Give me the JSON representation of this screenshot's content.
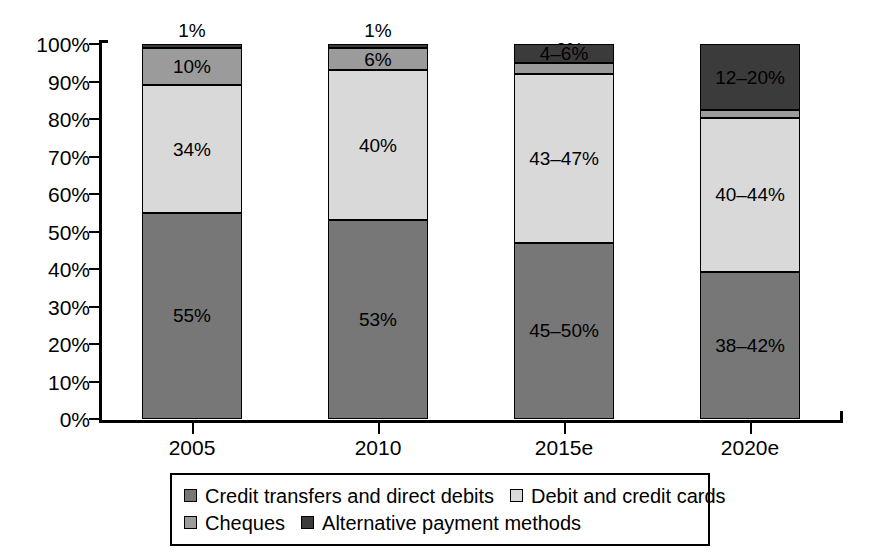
{
  "chart_data": {
    "type": "bar",
    "stacked": true,
    "normalized_percent": true,
    "title": "",
    "xlabel": "",
    "ylabel": "",
    "ylim": [
      0,
      100
    ],
    "grid": false,
    "legend_position": "bottom",
    "categories": [
      "2005",
      "2010",
      "2015e",
      "2020e"
    ],
    "ytick_labels": [
      "0%",
      "10%",
      "20%",
      "30%",
      "40%",
      "50%",
      "60%",
      "70%",
      "80%",
      "90%",
      "100%"
    ],
    "ytick_values": [
      0,
      10,
      20,
      30,
      40,
      50,
      60,
      70,
      80,
      90,
      100
    ],
    "series": [
      {
        "name": "Credit transfers and direct debits",
        "color": "#777777",
        "values": [
          55,
          53,
          47,
          40
        ],
        "labels": [
          "55%",
          "53%",
          "45–50%",
          "38–42%"
        ]
      },
      {
        "name": "Debit and credit cards",
        "color": "#d9d9d9",
        "values": [
          34,
          40,
          45,
          42
        ],
        "labels": [
          "34%",
          "40%",
          "43–47%",
          "40–44%"
        ]
      },
      {
        "name": "Cheques",
        "color": "#9b9b9b",
        "values": [
          10,
          6,
          3,
          2
        ],
        "labels": [
          "10%",
          "6%",
          "<3%",
          "<2%"
        ]
      },
      {
        "name": "Alternative payment methods",
        "color": "#3b3b3b",
        "values": [
          1,
          1,
          5,
          18
        ],
        "labels": [
          "1%",
          "1%",
          "4–6%",
          "12–20%"
        ]
      }
    ]
  },
  "legend": {
    "rows": [
      [
        {
          "label": "Credit transfers and direct debits",
          "color": "#777777"
        },
        {
          "label": "Debit and credit cards",
          "color": "#d9d9d9"
        }
      ],
      [
        {
          "label": "Cheques",
          "color": "#9b9b9b"
        },
        {
          "label": "Alternative payment methods",
          "color": "#3b3b3b"
        }
      ]
    ]
  }
}
